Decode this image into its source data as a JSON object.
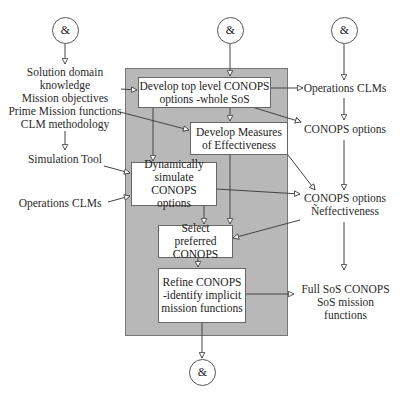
{
  "diagram": {
    "connectors": {
      "top_left": "&",
      "top_middle": "&",
      "top_right": "&",
      "bottom": "&"
    },
    "inputs": {
      "left_top": [
        "Solution domain",
        "knowledge",
        "Mission objectives",
        "Prime Mission functions",
        "CLM methodology"
      ],
      "simulation_tool": "Simulation Tool",
      "operations_clms": "Operations CLMs"
    },
    "process_boxes": {
      "develop_top_level": [
        "Develop top level CONOPS",
        "options -whole SoS"
      ],
      "develop_measures": [
        "Develop  Measures",
        "of Effectiveness"
      ],
      "dynamically_simulate": [
        "Dynamically",
        "simulate CONOPS",
        "options"
      ],
      "select_preferred": [
        "Select preferred",
        "CONOPS"
      ],
      "refine_conops": [
        "Refine CONOPS",
        "-identify implicit",
        "mission functions"
      ]
    },
    "outputs": {
      "operations_clms": "Operations CLMs",
      "conops_options": "CONOPS options",
      "conops_effectiveness": [
        "CONOPS options",
        "Ñeffectiveness"
      ],
      "full_sos": [
        "Full SoS CONOPS",
        "SoS mission",
        "functions"
      ]
    }
  }
}
